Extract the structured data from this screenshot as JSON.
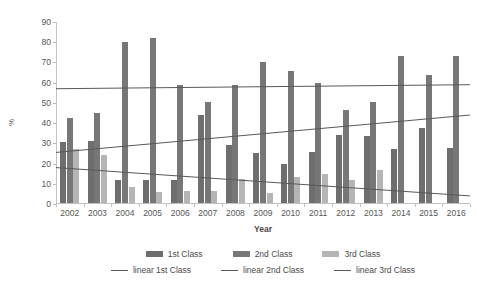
{
  "chart_data": {
    "type": "bar",
    "title": "",
    "xlabel": "Year",
    "ylabel": "%",
    "categories": [
      "2002",
      "2003",
      "2004",
      "2005",
      "2006",
      "2007",
      "2008",
      "2009",
      "2010",
      "2011",
      "2012",
      "2013",
      "2014",
      "2015",
      "2016"
    ],
    "ylim": [
      0,
      90
    ],
    "ytick_step": 10,
    "yticks": [
      0,
      10,
      20,
      30,
      40,
      50,
      60,
      70,
      80,
      90
    ],
    "grid": false,
    "legend_position": "bottom",
    "series": [
      {
        "name": "1st Class",
        "color": "#6e6e6e",
        "values": [
          30,
          30.5,
          11.5,
          11.5,
          11.5,
          43.5,
          28.5,
          24.5,
          19.5,
          25,
          33.5,
          33,
          26.5,
          37,
          27
        ]
      },
      {
        "name": "2nd Class",
        "color": "#777777",
        "values": [
          42,
          44.5,
          79.5,
          81.5,
          58.5,
          50,
          58.5,
          69.5,
          65.5,
          59.5,
          46,
          50,
          72.5,
          63.5,
          72.5
        ]
      },
      {
        "name": "3rd Class",
        "color": "#b5b5b5",
        "values": [
          26.5,
          23.5,
          8,
          5.5,
          6,
          6,
          12,
          5,
          13,
          14.5,
          11.5,
          16.5,
          0,
          0,
          0
        ]
      }
    ],
    "trendlines": [
      {
        "name": "linear 1st Class",
        "start": 57,
        "end": 59,
        "color": "#595959"
      },
      {
        "name": "linear 2nd Class",
        "start": 25.5,
        "end": 44,
        "color": "#595959"
      },
      {
        "name": "linear 3rd Class",
        "start": 18,
        "end": 4,
        "color": "#595959"
      }
    ]
  },
  "legend": {
    "row1": [
      {
        "label": "1st Class",
        "type": "bar",
        "color": "#6e6e6e"
      },
      {
        "label": "2nd Class",
        "type": "bar",
        "color": "#777777"
      },
      {
        "label": "3rd Class",
        "type": "bar",
        "color": "#b5b5b5"
      }
    ],
    "row2": [
      {
        "label": "linear 1st Class",
        "type": "line"
      },
      {
        "label": "linear 2nd Class",
        "type": "line"
      },
      {
        "label": "linear 3rd Class",
        "type": "line"
      }
    ]
  }
}
